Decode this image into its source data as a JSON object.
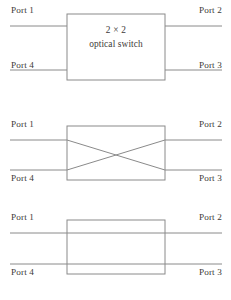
{
  "figure": {
    "geometry": {
      "width": 231,
      "height": 300,
      "panel_height": 100,
      "box_left": 67,
      "box_right": 165,
      "box_top": 14,
      "box_bottom": 80,
      "line_left_x": 10,
      "line_right_x": 222,
      "top_line_y": 26,
      "bottom_line_y": 70
    },
    "colors": {
      "line": "#8a8a8a",
      "box_border": "#8a8a8a",
      "text": "#3d3a38",
      "background": "#ffffff"
    },
    "panels": [
      {
        "id": "labeled",
        "state_name": "2 x 2 optical switch block",
        "box_label_line1": "2 × 2",
        "box_label_line2": "optical switch",
        "ports": {
          "top_left": "Port 1",
          "top_right": "Port 2",
          "bottom_left": "Port 4",
          "bottom_right": "Port 3"
        },
        "routing": "opaque-block"
      },
      {
        "id": "cross",
        "state_name": "cross state",
        "ports": {
          "top_left": "Port 1",
          "top_right": "Port 2",
          "bottom_left": "Port 4",
          "bottom_right": "Port 3"
        },
        "routing": "cross",
        "connections": [
          {
            "from": "Port 1",
            "to": "Port 3"
          },
          {
            "from": "Port 4",
            "to": "Port 2"
          }
        ]
      },
      {
        "id": "bar",
        "state_name": "bar state",
        "ports": {
          "top_left": "Port 1",
          "top_right": "Port 2",
          "bottom_left": "Port 4",
          "bottom_right": "Port 3"
        },
        "routing": "bar",
        "connections": [
          {
            "from": "Port 1",
            "to": "Port 2"
          },
          {
            "from": "Port 4",
            "to": "Port 3"
          }
        ]
      }
    ]
  }
}
